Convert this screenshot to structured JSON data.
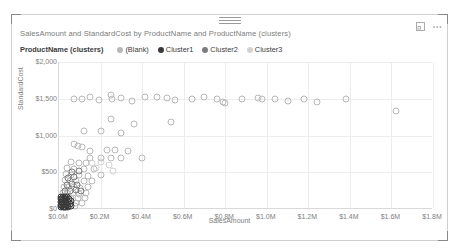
{
  "visual": {
    "title": "SalesAmount and StandardCost by ProductName and ProductName (clusters)",
    "drag_handle": "drag-handle",
    "focus_icon": "focus-mode-icon",
    "more_icon": "more-options-icon"
  },
  "legend": {
    "title": "ProductName (clusters)",
    "position": "top",
    "items": [
      {
        "label": "(Blank)",
        "color": "#b8b8b8"
      },
      {
        "label": "Cluster1",
        "color": "#3a3a3a"
      },
      {
        "label": "Cluster2",
        "color": "#7d7d7d"
      },
      {
        "label": "Cluster3",
        "color": "#d2d2d2"
      }
    ]
  },
  "chart_data": {
    "type": "scatter",
    "title": "SalesAmount and StandardCost by ProductName and ProductName (clusters)",
    "xlabel": "SalesAmount",
    "ylabel": "StandardCost",
    "xlim": [
      0,
      1800000
    ],
    "ylim": [
      0,
      2000
    ],
    "xticks": [
      "$0.0M",
      "$0.2M",
      "$0.4M",
      "$0.6M",
      "$0.8M",
      "$1.0M",
      "$1.2M",
      "$1.4M",
      "$1.6M",
      "$1.8M"
    ],
    "xtick_values": [
      0,
      200000,
      400000,
      600000,
      800000,
      1000000,
      1200000,
      1400000,
      1600000,
      1800000
    ],
    "yticks": [
      "$0",
      "$500",
      "$1,000",
      "$1,500",
      "$2,000"
    ],
    "ytick_values": [
      0,
      500,
      1000,
      1500,
      2000
    ],
    "grid": true,
    "legend_position": "top",
    "marker": "hollow-circle",
    "series": [
      {
        "name": "(Blank)",
        "color": "#b8b8b8",
        "points": [
          [
            70000,
            1500
          ],
          [
            112000,
            1490
          ],
          [
            150000,
            1520
          ],
          [
            192000,
            1480
          ],
          [
            252000,
            1545
          ],
          [
            255000,
            1500
          ],
          [
            300000,
            1510
          ],
          [
            350000,
            1470
          ],
          [
            416000,
            1520
          ],
          [
            470000,
            1530
          ],
          [
            520000,
            1505
          ],
          [
            560000,
            1480
          ],
          [
            640000,
            1500
          ],
          [
            700000,
            1520
          ],
          [
            760000,
            1490
          ],
          [
            790000,
            1450
          ],
          [
            800000,
            1440
          ],
          [
            880000,
            1500
          ],
          [
            960000,
            1505
          ],
          [
            975000,
            1500
          ],
          [
            1040000,
            1500
          ],
          [
            1100000,
            1470
          ],
          [
            1180000,
            1500
          ],
          [
            1240000,
            1460
          ],
          [
            1380000,
            1490
          ],
          [
            1620000,
            1340
          ],
          [
            250000,
            1230
          ],
          [
            360000,
            1160
          ],
          [
            540000,
            1180
          ],
          [
            120000,
            1060
          ],
          [
            200000,
            1055
          ],
          [
            300000,
            1040
          ],
          [
            70000,
            880
          ],
          [
            90000,
            860
          ],
          [
            110000,
            840
          ],
          [
            150000,
            790
          ],
          [
            230000,
            800
          ],
          [
            270000,
            800
          ],
          [
            330000,
            790
          ],
          [
            150000,
            700
          ],
          [
            200000,
            690
          ],
          [
            250000,
            700
          ],
          [
            300000,
            690
          ],
          [
            400000,
            700
          ],
          [
            60000,
            640
          ],
          [
            95000,
            630
          ],
          [
            130000,
            620
          ],
          [
            40000,
            560
          ],
          [
            70000,
            540
          ],
          [
            120000,
            550
          ],
          [
            170000,
            545
          ],
          [
            35000,
            470
          ],
          [
            60000,
            465
          ],
          [
            95000,
            460
          ],
          [
            140000,
            455
          ],
          [
            200000,
            460
          ],
          [
            30000,
            390
          ],
          [
            55000,
            380
          ],
          [
            80000,
            385
          ],
          [
            120000,
            380
          ],
          [
            160000,
            375
          ],
          [
            25000,
            300
          ],
          [
            45000,
            295
          ],
          [
            70000,
            300
          ],
          [
            100000,
            290
          ],
          [
            140000,
            295
          ],
          [
            20000,
            220
          ],
          [
            40000,
            215
          ],
          [
            65000,
            220
          ],
          [
            95000,
            210
          ],
          [
            130000,
            215
          ],
          [
            15000,
            150
          ],
          [
            35000,
            145
          ],
          [
            60000,
            150
          ],
          [
            90000,
            145
          ],
          [
            125000,
            150
          ],
          [
            12000,
            90
          ],
          [
            30000,
            85
          ],
          [
            55000,
            90
          ],
          [
            80000,
            85
          ],
          [
            110000,
            88
          ],
          [
            10000,
            45
          ],
          [
            28000,
            40
          ],
          [
            50000,
            45
          ],
          [
            75000,
            42
          ]
        ]
      },
      {
        "name": "Cluster1",
        "color": "#3a3a3a",
        "points": [
          [
            8000,
            60
          ],
          [
            14000,
            55
          ],
          [
            20000,
            62
          ],
          [
            26000,
            48
          ],
          [
            32000,
            58
          ],
          [
            10000,
            95
          ],
          [
            16000,
            100
          ],
          [
            22000,
            92
          ],
          [
            28000,
            105
          ],
          [
            34000,
            98
          ],
          [
            9000,
            130
          ],
          [
            15000,
            135
          ],
          [
            21000,
            128
          ],
          [
            27000,
            140
          ],
          [
            33000,
            132
          ],
          [
            11000,
            25
          ],
          [
            18000,
            30
          ],
          [
            24000,
            22
          ],
          [
            30000,
            32
          ],
          [
            36000,
            28
          ],
          [
            40000,
            60
          ],
          [
            44000,
            100
          ],
          [
            48000,
            130
          ],
          [
            42000,
            30
          ],
          [
            12000,
            165
          ],
          [
            20000,
            170
          ],
          [
            30000,
            160
          ],
          [
            38000,
            168
          ],
          [
            52000,
            70
          ],
          [
            56000,
            110
          ],
          [
            60000,
            40
          ]
        ]
      },
      {
        "name": "Cluster2",
        "color": "#7d7d7d",
        "points": [
          [
            30000,
            250
          ],
          [
            55000,
            245
          ],
          [
            80000,
            255
          ],
          [
            105000,
            240
          ],
          [
            38000,
            330
          ],
          [
            62000,
            340
          ],
          [
            88000,
            325
          ],
          [
            45000,
            420
          ],
          [
            72000,
            430
          ],
          [
            62000,
            510
          ],
          [
            95000,
            520
          ]
        ]
      },
      {
        "name": "Cluster3",
        "color": "#d2d2d2",
        "points": [
          [
            160000,
            620
          ],
          [
            200000,
            640
          ],
          [
            240000,
            600
          ],
          [
            180000,
            560
          ],
          [
            260000,
            520
          ]
        ]
      }
    ]
  }
}
